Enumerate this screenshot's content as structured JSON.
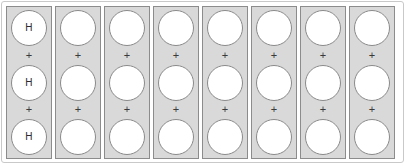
{
  "figure": {
    "name": "hydrogen-unit-column-diagram",
    "background_color": "#ffffff",
    "frame_color": "#c9c9c9",
    "column_fill_color": "#d9d9d9",
    "column_border_color": "#8c8c8c",
    "circle_fill_color": "#ffffff",
    "circle_border_color": "#8a8a8a",
    "label_color": "#2b2b2b",
    "operator": "+",
    "columns": [
      {
        "index": 1,
        "name": "column-1",
        "circles": [
          {
            "label": "H"
          },
          {
            "label": "H"
          },
          {
            "label": "H"
          }
        ],
        "operators": [
          "+",
          "+"
        ]
      },
      {
        "index": 2,
        "name": "column-2",
        "circles": [
          {
            "label": ""
          },
          {
            "label": ""
          },
          {
            "label": ""
          }
        ],
        "operators": [
          "+",
          "+"
        ]
      },
      {
        "index": 3,
        "name": "column-3",
        "circles": [
          {
            "label": ""
          },
          {
            "label": ""
          },
          {
            "label": ""
          }
        ],
        "operators": [
          "+",
          "+"
        ]
      },
      {
        "index": 4,
        "name": "column-4",
        "circles": [
          {
            "label": ""
          },
          {
            "label": ""
          },
          {
            "label": ""
          }
        ],
        "operators": [
          "+",
          "+"
        ]
      },
      {
        "index": 5,
        "name": "column-5",
        "circles": [
          {
            "label": ""
          },
          {
            "label": ""
          },
          {
            "label": ""
          }
        ],
        "operators": [
          "+",
          "+"
        ]
      },
      {
        "index": 6,
        "name": "column-6",
        "circles": [
          {
            "label": ""
          },
          {
            "label": ""
          },
          {
            "label": ""
          }
        ],
        "operators": [
          "+",
          "+"
        ]
      },
      {
        "index": 7,
        "name": "column-7",
        "circles": [
          {
            "label": ""
          },
          {
            "label": ""
          },
          {
            "label": ""
          }
        ],
        "operators": [
          "+",
          "+"
        ]
      },
      {
        "index": 8,
        "name": "column-8",
        "circles": [
          {
            "label": ""
          },
          {
            "label": ""
          },
          {
            "label": ""
          }
        ],
        "operators": [
          "+",
          "+"
        ]
      }
    ]
  }
}
